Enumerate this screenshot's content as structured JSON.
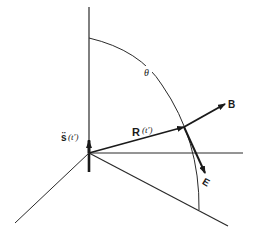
{
  "diagram": {
    "labels": {
      "theta": "θ",
      "R_vec": "R",
      "R_arg": "(t′)",
      "B_vec": "B",
      "E_vec": "E",
      "s_vec": "s̈",
      "s_arg": "(t′)"
    },
    "colors": {
      "line": "#2a2a2a",
      "background": "#ffffff"
    }
  }
}
